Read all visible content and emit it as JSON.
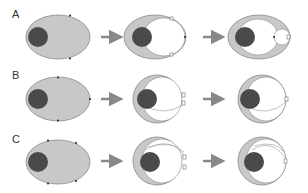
{
  "rows": [
    {
      "label": "A"
    },
    {
      "label": "B"
    },
    {
      "label": "C"
    }
  ],
  "colors": {
    "cytoplasm": "#c8c8c8",
    "nucleus": "#4a4a4a",
    "outline": "#888888",
    "arrow": "#888888",
    "vacuole": "#ffffff"
  }
}
